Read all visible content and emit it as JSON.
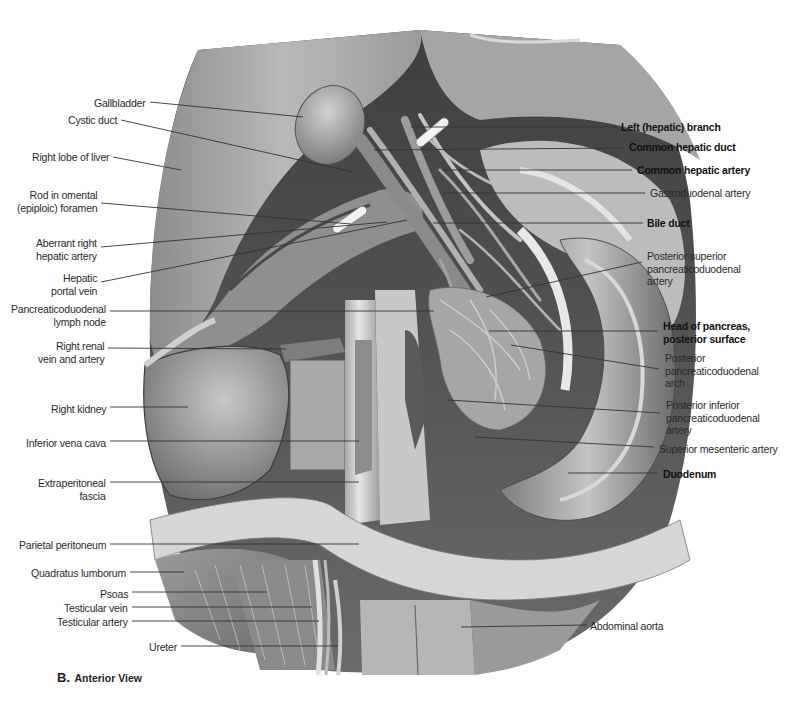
{
  "figure": {
    "panel_letter": "B.",
    "view_title": "Anterior View",
    "style": {
      "background": "#ffffff",
      "line_color": "#3a3a3a",
      "text_color": "#2a2a2a"
    }
  },
  "labels_left": [
    {
      "text": "Gallbladder",
      "lines": [
        "Gallbladder"
      ],
      "x": 147,
      "y": 97,
      "from": [
        150,
        102
      ],
      "to": [
        303,
        117
      ]
    },
    {
      "text": "Cystic duct",
      "lines": [
        "Cystic duct"
      ],
      "x": 118,
      "y": 114,
      "from": [
        121,
        120
      ],
      "to": [
        353,
        172
      ]
    },
    {
      "text": "Right lobe of liver",
      "lines": [
        "Right lobe of liver"
      ],
      "x": 110,
      "y": 151,
      "from": [
        113,
        157
      ],
      "to": [
        181,
        170
      ]
    },
    {
      "text": "Rod in omental (epiploic) foramen",
      "lines": [
        "Rod in omental",
        "(epiploic) foramen"
      ],
      "x": 100,
      "y": 189,
      "from": [
        101,
        203
      ],
      "to": [
        351,
        224
      ]
    },
    {
      "text": "Aberrant right hepatic artery",
      "lines": [
        "Aberrant right",
        "hepatic artery"
      ],
      "x": 100,
      "y": 237,
      "from": [
        101,
        247
      ],
      "to": [
        387,
        222
      ]
    },
    {
      "text": "Hepatic portal vein",
      "lines": [
        "Hepatic",
        "portal vein"
      ],
      "x": 100,
      "y": 272,
      "from": [
        101,
        282
      ],
      "to": [
        407,
        220
      ]
    },
    {
      "text": "Pancreaticoduodenal lymph node",
      "lines": [
        "Pancreaticoduodenal",
        "lymph node"
      ],
      "x": 109,
      "y": 303,
      "from": [
        110,
        311
      ],
      "to": [
        434,
        311
      ]
    },
    {
      "text": "Right renal vein and artery",
      "lines": [
        "Right renal",
        "vein and artery"
      ],
      "x": 107,
      "y": 340,
      "from": [
        108,
        348
      ],
      "to": [
        286,
        349
      ]
    },
    {
      "text": "Right kidney",
      "lines": [
        "Right kidney"
      ],
      "x": 108,
      "y": 403,
      "from": [
        110,
        407
      ],
      "to": [
        188,
        407
      ]
    },
    {
      "text": "Inferior vena cava",
      "lines": [
        "Inferior vena cava"
      ],
      "x": 108,
      "y": 437,
      "from": [
        110,
        441
      ],
      "to": [
        359,
        441
      ]
    },
    {
      "text": "Extraperitoneal fascia",
      "lines": [
        "Extraperitoneal",
        "fascia"
      ],
      "x": 108,
      "y": 477,
      "from": [
        110,
        482
      ],
      "to": [
        359,
        482
      ]
    },
    {
      "text": "Parietal peritoneum",
      "lines": [
        "Parietal peritoneum"
      ],
      "x": 108,
      "y": 539,
      "from": [
        110,
        544
      ],
      "to": [
        359,
        544
      ]
    },
    {
      "text": "Quadratus lumborum",
      "lines": [
        "Quadratus lumborum"
      ],
      "x": 128,
      "y": 567,
      "from": [
        130,
        572
      ],
      "to": [
        184,
        572
      ]
    },
    {
      "text": "Psoas",
      "lines": [
        "Psoas"
      ],
      "x": 128,
      "y": 588,
      "from": [
        132,
        592
      ],
      "to": [
        267,
        592
      ]
    },
    {
      "text": "Testicular vein",
      "lines": [
        "Testicular vein"
      ],
      "x": 128,
      "y": 602,
      "from": [
        132,
        607
      ],
      "to": [
        312,
        607
      ]
    },
    {
      "text": "Testicular artery",
      "lines": [
        "Testicular artery"
      ],
      "x": 128,
      "y": 616,
      "from": [
        132,
        621
      ],
      "to": [
        319,
        621
      ]
    },
    {
      "text": "Ureter",
      "lines": [
        "Ureter"
      ],
      "x": 177,
      "y": 641,
      "from": [
        181,
        646
      ],
      "to": [
        338,
        646
      ]
    }
  ],
  "labels_right": [
    {
      "text": "Left (hepatic) branch",
      "lines": [
        "Left (hepatic) branch"
      ],
      "bold": true,
      "x": 621,
      "y": 121,
      "from": [
        617,
        127
      ],
      "to": [
        411,
        127
      ]
    },
    {
      "text": "Common hepatic duct",
      "lines": [
        "Common hepatic duct"
      ],
      "bold": true,
      "x": 629,
      "y": 141,
      "from": [
        624,
        148
      ],
      "to": [
        374,
        150
      ]
    },
    {
      "text": "Common hepatic artery",
      "lines": [
        "Common hepatic artery"
      ],
      "bold": true,
      "x": 637,
      "y": 164,
      "from": [
        632,
        170
      ],
      "to": [
        442,
        170
      ]
    },
    {
      "text": "Gastroduodenal artery",
      "lines": [
        "Gastroduodenal artery"
      ],
      "bold": false,
      "x": 650,
      "y": 187,
      "from": [
        645,
        193
      ],
      "to": [
        443,
        193
      ]
    },
    {
      "text": "Bile duct",
      "lines": [
        "Bile duct"
      ],
      "bold": true,
      "x": 647,
      "y": 217,
      "from": [
        643,
        223
      ],
      "to": [
        433,
        223
      ]
    },
    {
      "text": "Posterior superior pancreaticoduodenal artery",
      "lines": [
        "Posterior superior",
        "pancreaticoduodenal",
        "artery"
      ],
      "bold": false,
      "x": 647,
      "y": 250,
      "from": [
        642,
        262
      ],
      "to": [
        486,
        297
      ]
    },
    {
      "text": "Head of pancreas, posterior surface",
      "lines": [
        "Head of pancreas,",
        "posterior surface"
      ],
      "bold": true,
      "x": 663,
      "y": 320,
      "from": [
        658,
        331
      ],
      "to": [
        489,
        331
      ]
    },
    {
      "text": "Posterior pancreaticoduodenal arch",
      "lines": [
        "Posterior",
        "pancreaticoduodenal",
        "arch"
      ],
      "bold": false,
      "x": 665,
      "y": 352,
      "from": [
        659,
        369
      ],
      "to": [
        511,
        345
      ]
    },
    {
      "text": "Posterior inferior pancreaticoduodenal artery",
      "lines": [
        "Posterior inferior",
        "pancreaticoduodenal",
        "artery"
      ],
      "bold": false,
      "x": 666,
      "y": 399,
      "from": [
        660,
        413
      ],
      "to": [
        448,
        400
      ]
    },
    {
      "text": "Superior mesenteric artery",
      "lines": [
        "Superior mesenteric artery"
      ],
      "bold": false,
      "x": 659,
      "y": 443,
      "from": [
        654,
        447
      ],
      "to": [
        475,
        437
      ]
    },
    {
      "text": "Duodenum",
      "lines": [
        "Duodenum"
      ],
      "bold": true,
      "x": 663,
      "y": 468,
      "from": [
        658,
        473
      ],
      "to": [
        568,
        473
      ]
    },
    {
      "text": "Abdominal aorta",
      "lines": [
        "Abdominal aorta"
      ],
      "bold": false,
      "x": 590,
      "y": 620,
      "from": [
        586,
        625
      ],
      "to": [
        461,
        627
      ]
    }
  ]
}
